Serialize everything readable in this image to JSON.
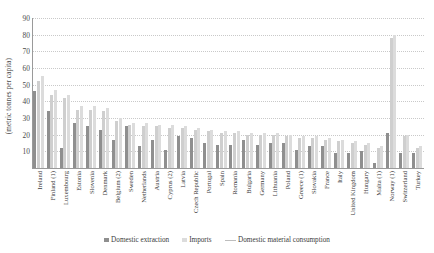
{
  "chart_data": {
    "type": "bar",
    "title": "",
    "xlabel": "",
    "ylabel": "(metric tonnes per capita)",
    "ylim": [
      0,
      90
    ],
    "yticks": [
      0,
      10,
      20,
      30,
      40,
      50,
      60,
      70,
      80,
      90
    ],
    "ytick_labels": [
      "",
      "10",
      "20",
      "30",
      "40",
      "50",
      "60",
      "70",
      "80",
      "90"
    ],
    "grid": true,
    "legend_position": "bottom",
    "categories": [
      "Ireland",
      "Finland (1)",
      "Luxembourg",
      "Estonia",
      "Slovenia",
      "Denmark",
      "Belgium (2)",
      "Sweden",
      "Netherlands",
      "Austria",
      "Cyprus (2)",
      "Latvia",
      "Czech Republic",
      "Portugal",
      "Spain",
      "Romania",
      "Bulgaria",
      "Germany",
      "Lithuania",
      "Poland",
      "Greece (1)",
      "Slovakia",
      "France",
      "Italy",
      "United Kingdom",
      "Hungary",
      "Malta (1)",
      "Norway (1)",
      "Switzerland",
      "Turkey"
    ],
    "series": [
      {
        "name": "Domestic extraction",
        "color": "#8f8f8f",
        "values": [
          46,
          34,
          12,
          27,
          25,
          23,
          17,
          25,
          13,
          17,
          11,
          19,
          18,
          15,
          14,
          14,
          17,
          14,
          15,
          15,
          11,
          13,
          13,
          9,
          9,
          10,
          3,
          21,
          9,
          9
        ]
      },
      {
        "name": "Imports",
        "color": "#dcdcdc",
        "values": [
          55,
          47,
          44,
          37,
          37,
          36,
          30,
          27,
          27,
          26,
          26,
          25,
          24,
          23,
          22,
          22,
          21,
          21,
          21,
          20,
          19,
          19,
          18,
          17,
          16,
          15,
          13,
          80,
          20,
          13
        ]
      },
      {
        "name": "Domestic material consumption",
        "color": "#cfcfcf",
        "values": [
          52,
          44,
          42,
          35,
          35,
          34,
          28,
          26,
          25,
          25,
          24,
          24,
          23,
          22,
          21,
          21,
          20,
          20,
          20,
          19,
          18,
          18,
          17,
          16,
          15,
          14,
          12,
          78,
          19,
          12
        ]
      }
    ]
  },
  "legend": {
    "items": [
      {
        "label": "Domestic extraction",
        "marker": "square",
        "color": "#8f8f8f"
      },
      {
        "label": "Imports",
        "marker": "square",
        "color": "#dcdcdc"
      },
      {
        "label": "Domestic material consumption",
        "marker": "line",
        "color": "#bdbdbd"
      }
    ]
  }
}
